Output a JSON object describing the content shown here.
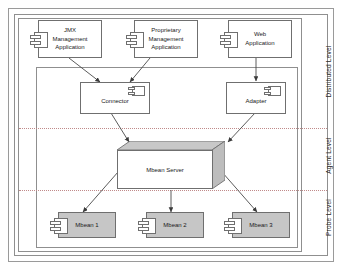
{
  "diagram": {
    "type": "uml-component-diagram",
    "levels": [
      {
        "id": "distributed",
        "label": "Distributed Level"
      },
      {
        "id": "agent",
        "label": "Agent Level"
      },
      {
        "id": "probe",
        "label": "Probe Level"
      }
    ],
    "nodes": {
      "jmx_app": {
        "label": "JMX\nManagement\nApplication",
        "line1": "JMX",
        "line2": "Management",
        "line3": "Application"
      },
      "proprietary_app": {
        "label": "Proprietary Management Application",
        "line1": "Proprietary",
        "line2": "Management",
        "line3": "Application"
      },
      "web_app": {
        "label": "Web Application",
        "line1": "Web",
        "line2": "Application",
        "line3": ""
      },
      "connector": {
        "label": "Connector"
      },
      "adapter": {
        "label": "Adapter"
      },
      "mbean_server": {
        "label": "Mbean Server"
      },
      "mbean1": {
        "label": "Mbean 1"
      },
      "mbean2": {
        "label": "Mbean 2"
      },
      "mbean3": {
        "label": "Mbean 3"
      }
    },
    "edges": [
      {
        "from": "jmx_app",
        "to": "connector"
      },
      {
        "from": "proprietary_app",
        "to": "connector"
      },
      {
        "from": "web_app",
        "to": "adapter"
      },
      {
        "from": "connector",
        "to": "mbean_server"
      },
      {
        "from": "adapter",
        "to": "mbean_server"
      },
      {
        "from": "mbean_server",
        "to": "mbean1"
      },
      {
        "from": "mbean_server",
        "to": "mbean2"
      },
      {
        "from": "mbean_server",
        "to": "mbean3"
      }
    ],
    "colors": {
      "stroke": "#6f6f6f",
      "frame": "#8f8f8f",
      "shaded_fill": "#c6c6c6",
      "separator": "#c08a8a",
      "text": "#1a1a1a",
      "background": "#ffffff"
    }
  }
}
